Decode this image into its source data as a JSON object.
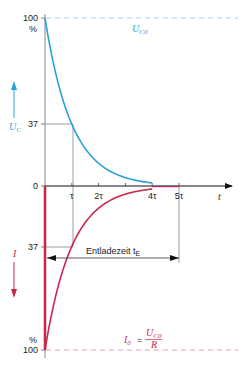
{
  "colors": {
    "voltage": "#2aa0d8",
    "current": "#c8284e",
    "axis": "#222222",
    "guide": "#888888",
    "dashed_voltage": "#a8d4ee",
    "dashed_current": "#e8a4b4"
  },
  "axes": {
    "y_top_labels": {
      "v100": "100",
      "pct": "%",
      "v37": "37",
      "zero": "0"
    },
    "y_bottom_labels": {
      "v37": "37",
      "pct": "%",
      "v100": "100"
    },
    "x_ticks": [
      "τ",
      "2τ",
      "4τ",
      "5τ"
    ],
    "x_tick_values": [
      1,
      2,
      4,
      5
    ],
    "x_label": "t"
  },
  "labels": {
    "uc_axis": "U",
    "uc_axis_sub": "C",
    "i_axis": "I",
    "uc0": "U",
    "uc0_sub": "C0",
    "i0_lhs": "I",
    "i0_lhs_sub": "0",
    "i0_eq": "=",
    "i0_num": "U",
    "i0_num_sub": "C0",
    "i0_den": "R",
    "entladezeit": "Entladezeit t",
    "entladezeit_sub": "E"
  },
  "chart_data": {
    "type": "line",
    "title": "",
    "xlabel": "t",
    "x_unit": "τ",
    "xlim": [
      0,
      6
    ],
    "ylim_voltage_percent": [
      0,
      100
    ],
    "ylim_current_percent": [
      0,
      -100
    ],
    "marked_level_percent": 37,
    "series": [
      {
        "name": "U_C",
        "formula": "100*exp(-t/τ)",
        "color": "#2aa0d8",
        "end_at_tau": 5
      },
      {
        "name": "I",
        "formula": "-100*exp(-t/τ)",
        "color": "#c8284e",
        "end_at_tau": 5
      }
    ],
    "annotations": [
      {
        "text": "U_C0",
        "level_percent": 100
      },
      {
        "text": "I_0 = U_C0 / R",
        "level_percent": -100
      },
      {
        "text": "Entladezeit t_E",
        "from_tau": 0,
        "to_tau": 5
      }
    ]
  }
}
